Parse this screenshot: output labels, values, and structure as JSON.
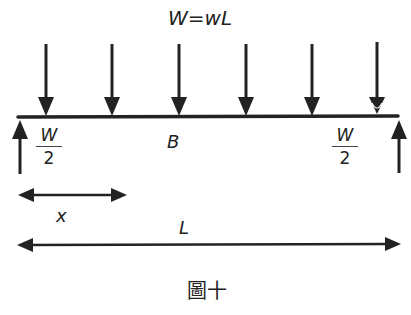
{
  "diagram": {
    "title": "W=wL",
    "midpoint_label": "B",
    "left_reaction": {
      "numerator": "W",
      "denominator": "2"
    },
    "right_reaction": {
      "numerator": "W",
      "denominator": "2"
    },
    "distance_label": "x",
    "span_label": "L",
    "caption": "圖十",
    "load_arrow_count": 6,
    "stroke_color": "#222222"
  }
}
